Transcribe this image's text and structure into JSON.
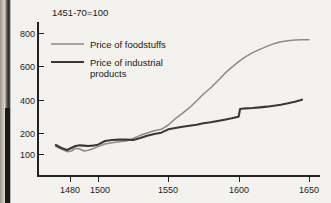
{
  "chart_data": {
    "type": "line",
    "title": "1451-70=100",
    "xlabel": "",
    "ylabel": "",
    "xlim": [
      1470,
      1650
    ],
    "ylim": [
      0,
      860
    ],
    "grid": false,
    "legend_position": "top-left",
    "xticks": [
      1480,
      1500,
      1550,
      1600,
      1650
    ],
    "xtick_labels": [
      "1480",
      "1500",
      "1550",
      "1600",
      "1650"
    ],
    "yticks": [
      100,
      200,
      400,
      600,
      800
    ],
    "ytick_labels": [
      "100",
      "200",
      "400",
      "600",
      "800"
    ],
    "series": [
      {
        "name": "Price of foodstuffs",
        "color": "#8d8a86",
        "x": [
          1470,
          1474,
          1478,
          1481,
          1484,
          1487,
          1490,
          1493,
          1496,
          1500,
          1505,
          1510,
          1515,
          1520,
          1525,
          1530,
          1535,
          1540,
          1545,
          1550,
          1555,
          1560,
          1565,
          1570,
          1575,
          1580,
          1585,
          1590,
          1595,
          1600,
          1605,
          1610,
          1615,
          1620,
          1625,
          1630,
          1635,
          1640,
          1645,
          1650
        ],
        "values": [
          118,
          104,
          88,
          92,
          108,
          104,
          92,
          96,
          104,
          118,
          134,
          142,
          148,
          152,
          168,
          186,
          200,
          214,
          222,
          248,
          286,
          318,
          352,
          392,
          434,
          470,
          512,
          556,
          594,
          628,
          658,
          682,
          702,
          720,
          736,
          748,
          754,
          758,
          760,
          760
        ]
      },
      {
        "name": "Price of industrial products",
        "color": "#3a3835",
        "x": [
          1470,
          1474,
          1478,
          1481,
          1484,
          1487,
          1490,
          1493,
          1496,
          1500,
          1505,
          1510,
          1515,
          1520,
          1525,
          1530,
          1535,
          1540,
          1545,
          1550,
          1555,
          1560,
          1565,
          1570,
          1575,
          1580,
          1585,
          1590,
          1595,
          1600,
          1601,
          1605,
          1610,
          1615,
          1620,
          1625,
          1630,
          1635,
          1640,
          1645
        ],
        "values": [
          128,
          110,
          98,
          110,
          122,
          126,
          124,
          122,
          124,
          130,
          152,
          158,
          160,
          160,
          158,
          170,
          184,
          194,
          202,
          222,
          230,
          238,
          244,
          250,
          258,
          264,
          272,
          280,
          288,
          298,
          344,
          348,
          350,
          354,
          358,
          364,
          370,
          378,
          388,
          400
        ]
      }
    ]
  },
  "legend": {
    "items": [
      {
        "label": "Price of foodstuffs"
      },
      {
        "label": "Price of industrial",
        "label2": "products"
      }
    ]
  }
}
